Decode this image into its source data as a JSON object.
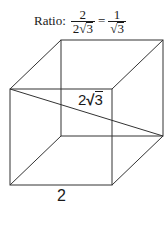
{
  "ratio": {
    "label": "Ratio:",
    "lhs": {
      "numerator": "2",
      "denominator_coef": "2",
      "denominator_radical": "3"
    },
    "equals": "=",
    "rhs": {
      "numerator": "1",
      "denominator_radical": "3"
    },
    "radical_sign": "√"
  },
  "cube": {
    "stroke_color": "#333333",
    "diagonal_label": {
      "coef": "2",
      "radical": "3",
      "radical_sign": "√"
    },
    "edge_label": "2"
  }
}
